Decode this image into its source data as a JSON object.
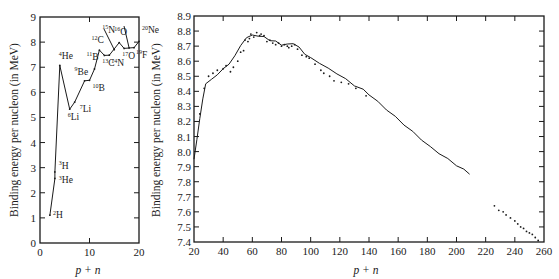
{
  "chart_data": [
    {
      "type": "line",
      "title": "",
      "xlabel": "p + n",
      "ylabel": "Binding energy per nucleon (in MeV)",
      "xlim": [
        0,
        20
      ],
      "ylim": [
        0,
        9
      ],
      "xticks": [
        "0",
        "10",
        "20"
      ],
      "yticks": [
        "0",
        "1",
        "2",
        "3",
        "4",
        "5",
        "6",
        "7",
        "8",
        "9"
      ],
      "grid": false,
      "series": [
        {
          "name": "light nuclei",
          "points": [
            {
              "label": "2H",
              "mass": "2",
              "sym": "H",
              "x": 2,
              "y": 1.11
            },
            {
              "label": "3He",
              "mass": "3",
              "sym": "He",
              "x": 3,
              "y": 2.57
            },
            {
              "label": "3H",
              "mass": "3",
              "sym": "H",
              "x": 3,
              "y": 2.83
            },
            {
              "label": "4He",
              "mass": "4",
              "sym": "He",
              "x": 4,
              "y": 7.07
            },
            {
              "label": "6Li",
              "mass": "6",
              "sym": "Li",
              "x": 6,
              "y": 5.33
            },
            {
              "label": "7Li",
              "mass": "7",
              "sym": "Li",
              "x": 7,
              "y": 5.61
            },
            {
              "label": "9Be",
              "mass": "9",
              "sym": "Be",
              "x": 9,
              "y": 6.46
            },
            {
              "label": "10B",
              "mass": "10",
              "sym": "B",
              "x": 10,
              "y": 6.48
            },
            {
              "label": "11B",
              "mass": "11",
              "sym": "B",
              "x": 11,
              "y": 6.93
            },
            {
              "label": "12C",
              "mass": "12",
              "sym": "C",
              "x": 12,
              "y": 7.68
            },
            {
              "label": "13C",
              "mass": "13",
              "sym": "C",
              "x": 13,
              "y": 7.47
            },
            {
              "label": "14N",
              "mass": "14",
              "sym": "N",
              "x": 14,
              "y": 7.48
            },
            {
              "label": "15N",
              "mass": "15",
              "sym": "N",
              "x": 15,
              "y": 7.7
            },
            {
              "label": "16O",
              "mass": "16",
              "sym": "O",
              "x": 16,
              "y": 7.98
            },
            {
              "label": "17O",
              "mass": "17",
              "sym": "O",
              "x": 17,
              "y": 7.75
            },
            {
              "label": "18O",
              "mass": "18",
              "sym": "O",
              "x": 18,
              "y": 7.77
            },
            {
              "label": "19F",
              "mass": "19",
              "sym": "F",
              "x": 19,
              "y": 7.78
            },
            {
              "label": "20Ne",
              "mass": "20",
              "sym": "Ne",
              "x": 20,
              "y": 8.03
            }
          ]
        }
      ]
    },
    {
      "type": "line",
      "title": "",
      "xlabel": "p + n",
      "ylabel": "Binding energy per nucleon (in MeV)",
      "xlim": [
        20,
        260
      ],
      "ylim": [
        7.4,
        8.9
      ],
      "xticks": [
        "20",
        "40",
        "60",
        "80",
        "100",
        "120",
        "140",
        "160",
        "180",
        "200",
        "220",
        "240",
        "260"
      ],
      "yticks": [
        "7.4",
        "7.5",
        "7.6",
        "7.7",
        "7.8",
        "7.9",
        "8.0",
        "8.1",
        "8.2",
        "8.3",
        "8.4",
        "8.5",
        "8.6",
        "8.7",
        "8.8",
        "8.9"
      ],
      "grid": false,
      "series": [
        {
          "name": "smoothed curve",
          "x": [
            20,
            22,
            24,
            26,
            28,
            32,
            36,
            40,
            44,
            48,
            52,
            56,
            60,
            64,
            68,
            72,
            76,
            80,
            84,
            88,
            92,
            96,
            100,
            106,
            112,
            118,
            124,
            130,
            136,
            140,
            146,
            152,
            158,
            164,
            170,
            176,
            182,
            188,
            194,
            200,
            205,
            209
          ],
          "y": [
            7.95,
            8.08,
            8.22,
            8.35,
            8.45,
            8.48,
            8.51,
            8.55,
            8.58,
            8.64,
            8.7,
            8.76,
            8.77,
            8.77,
            8.76,
            8.74,
            8.73,
            8.71,
            8.71,
            8.72,
            8.69,
            8.65,
            8.62,
            8.59,
            8.55,
            8.52,
            8.48,
            8.44,
            8.41,
            8.38,
            8.33,
            8.28,
            8.23,
            8.18,
            8.13,
            8.08,
            8.03,
            7.99,
            7.95,
            7.91,
            7.88,
            7.85
          ]
        },
        {
          "name": "measured nuclei (scatter)",
          "x": [
            24,
            27,
            30,
            33,
            36,
            40,
            42,
            45,
            47,
            50,
            52,
            54,
            55,
            57,
            58,
            59,
            61,
            63,
            65,
            66,
            68,
            70,
            72,
            74,
            76,
            78,
            80,
            82,
            84,
            85,
            87,
            89,
            91,
            94,
            97,
            99,
            103,
            107,
            109,
            113,
            116,
            121,
            126,
            131,
            138
          ],
          "y": [
            8.25,
            8.42,
            8.5,
            8.52,
            8.54,
            8.55,
            8.57,
            8.53,
            8.56,
            8.6,
            8.66,
            8.67,
            8.74,
            8.73,
            8.75,
            8.78,
            8.76,
            8.79,
            8.77,
            8.78,
            8.77,
            8.73,
            8.74,
            8.72,
            8.71,
            8.72,
            8.7,
            8.71,
            8.7,
            8.69,
            8.7,
            8.71,
            8.68,
            8.64,
            8.63,
            8.62,
            8.58,
            8.54,
            8.52,
            8.5,
            8.47,
            8.46,
            8.45,
            8.42,
            8.37
          ]
        },
        {
          "name": "heavy nuclei (scatter)",
          "x": [
            226,
            229,
            232,
            234,
            237,
            240,
            242,
            244,
            246,
            248,
            250,
            252,
            254,
            256
          ],
          "y": [
            7.64,
            7.61,
            7.6,
            7.58,
            7.56,
            7.54,
            7.52,
            7.5,
            7.49,
            7.47,
            7.46,
            7.45,
            7.43,
            7.41
          ]
        }
      ]
    }
  ]
}
